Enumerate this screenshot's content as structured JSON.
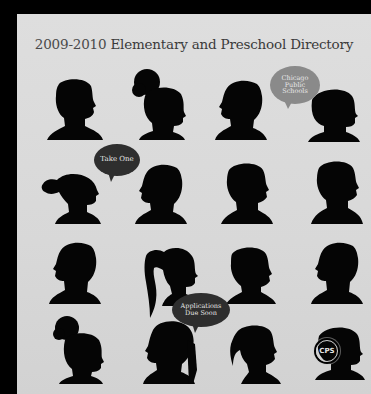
{
  "cover": {
    "title_years": "2009-2010",
    "title_text": "Elementary and Preschool Directory",
    "background_color": "#dcdcdc",
    "silhouette_color": "#050505"
  },
  "bubbles": [
    {
      "id": "chicago",
      "lines": [
        "Chicago",
        "Public",
        "Schools"
      ],
      "color": "#8a8a8a"
    },
    {
      "id": "take-one",
      "lines": [
        "Take One"
      ],
      "color": "#2e2e2e"
    },
    {
      "id": "applications",
      "lines": [
        "Applications",
        "Due Soon"
      ],
      "color": "#2e2e2e"
    }
  ],
  "logo": {
    "text": "CPS"
  },
  "silhouettes": [
    {
      "row": 1,
      "col": 1,
      "description": "boy short hair facing right"
    },
    {
      "row": 1,
      "col": 2,
      "description": "girl afro puff facing right"
    },
    {
      "row": 1,
      "col": 3,
      "description": "child short hair facing left"
    },
    {
      "row": 1,
      "col": 4,
      "description": "child bob hair facing right"
    },
    {
      "row": 2,
      "col": 1,
      "description": "girl pigtail facing right"
    },
    {
      "row": 2,
      "col": 2,
      "description": "child short hair facing left"
    },
    {
      "row": 2,
      "col": 3,
      "description": "child short hair facing right"
    },
    {
      "row": 2,
      "col": 4,
      "description": "boy short hair facing right"
    },
    {
      "row": 3,
      "col": 1,
      "description": "boy short hair facing left"
    },
    {
      "row": 3,
      "col": 2,
      "description": "girl ponytail facing right"
    },
    {
      "row": 3,
      "col": 3,
      "description": "boy short hair facing right"
    },
    {
      "row": 3,
      "col": 4,
      "description": "boy short hair facing left"
    },
    {
      "row": 4,
      "col": 1,
      "description": "girl afro puff facing right"
    },
    {
      "row": 4,
      "col": 2,
      "description": "girl braids facing left"
    },
    {
      "row": 4,
      "col": 3,
      "description": "girl ponytail facing right"
    },
    {
      "row": 4,
      "col": 4,
      "description": "child with CPS logo facing right"
    }
  ]
}
